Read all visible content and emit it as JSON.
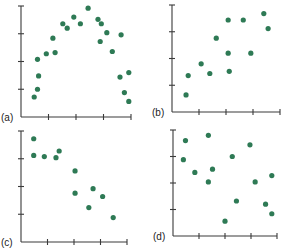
{
  "chart_data": [
    {
      "type": "scatter",
      "panel_label": "(a)",
      "title": "",
      "xlabel": "",
      "ylabel": "",
      "grid": false,
      "x_ticks": 4,
      "y_ticks": 4,
      "description": "Curved (inverted-U) relationship",
      "points": [
        [
          0.12,
          0.18
        ],
        [
          0.15,
          0.25
        ],
        [
          0.16,
          0.37
        ],
        [
          0.15,
          0.52
        ],
        [
          0.23,
          0.57
        ],
        [
          0.31,
          0.58
        ],
        [
          0.29,
          0.71
        ],
        [
          0.38,
          0.84
        ],
        [
          0.42,
          0.8
        ],
        [
          0.48,
          0.9
        ],
        [
          0.54,
          0.84
        ],
        [
          0.61,
          0.98
        ],
        [
          0.7,
          0.88
        ],
        [
          0.73,
          0.84
        ],
        [
          0.78,
          0.76
        ],
        [
          0.72,
          0.68
        ],
        [
          0.83,
          0.59
        ],
        [
          0.91,
          0.74
        ],
        [
          0.9,
          0.36
        ],
        [
          0.98,
          0.4
        ],
        [
          0.94,
          0.22
        ],
        [
          0.98,
          0.14
        ]
      ]
    },
    {
      "type": "scatter",
      "panel_label": "(b)",
      "title": "",
      "xlabel": "",
      "ylabel": "",
      "grid": false,
      "x_ticks": 4,
      "y_ticks": 4,
      "description": "Positive linear relationship",
      "points": [
        [
          0.13,
          0.16
        ],
        [
          0.15,
          0.34
        ],
        [
          0.27,
          0.45
        ],
        [
          0.35,
          0.36
        ],
        [
          0.41,
          0.69
        ],
        [
          0.52,
          0.86
        ],
        [
          0.52,
          0.55
        ],
        [
          0.53,
          0.38
        ],
        [
          0.66,
          0.86
        ],
        [
          0.73,
          0.55
        ],
        [
          0.85,
          0.92
        ],
        [
          0.89,
          0.78
        ]
      ]
    },
    {
      "type": "scatter",
      "panel_label": "(c)",
      "title": "",
      "xlabel": "",
      "ylabel": "",
      "grid": false,
      "x_ticks": 4,
      "y_ticks": 4,
      "description": "Negative linear relationship",
      "points": [
        [
          0.12,
          0.93
        ],
        [
          0.12,
          0.78
        ],
        [
          0.22,
          0.77
        ],
        [
          0.33,
          0.76
        ],
        [
          0.36,
          0.82
        ],
        [
          0.51,
          0.64
        ],
        [
          0.51,
          0.44
        ],
        [
          0.68,
          0.48
        ],
        [
          0.77,
          0.41
        ],
        [
          0.64,
          0.31
        ],
        [
          0.87,
          0.22
        ]
      ]
    },
    {
      "type": "scatter",
      "panel_label": "(d)",
      "title": "",
      "xlabel": "",
      "ylabel": "",
      "grid": false,
      "x_ticks": 4,
      "y_ticks": 4,
      "description": "No relationship",
      "points": [
        [
          0.12,
          0.9
        ],
        [
          0.34,
          0.95
        ],
        [
          0.1,
          0.72
        ],
        [
          0.21,
          0.6
        ],
        [
          0.38,
          0.63
        ],
        [
          0.34,
          0.51
        ],
        [
          0.57,
          0.75
        ],
        [
          0.74,
          0.86
        ],
        [
          0.61,
          0.33
        ],
        [
          0.5,
          0.14
        ],
        [
          0.79,
          0.51
        ],
        [
          0.95,
          0.57
        ],
        [
          0.89,
          0.3
        ],
        [
          0.95,
          0.21
        ]
      ]
    }
  ],
  "panels": [
    {
      "label": "(a)",
      "ox": 21,
      "oy": 117,
      "w": 110,
      "h": 111
    },
    {
      "label": "(b)",
      "ox": 172,
      "oy": 112,
      "w": 108,
      "h": 107
    },
    {
      "label": "(c)",
      "ox": 21,
      "oy": 242,
      "w": 106,
      "h": 111
    },
    {
      "label": "(d)",
      "ox": 173,
      "oy": 236,
      "w": 104,
      "h": 106
    }
  ],
  "style": {
    "point_color": "#2e7a55",
    "axis_color": "#3a3a3a"
  }
}
